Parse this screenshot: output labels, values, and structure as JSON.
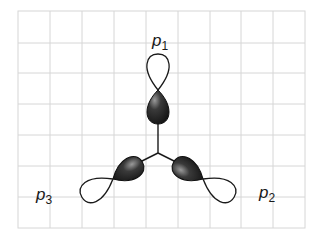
{
  "diagram": {
    "grid": {
      "x0": 18,
      "y0": 11,
      "x1": 305,
      "y1": 228,
      "cols": 9,
      "rows": 7,
      "color": "#d6d6d6"
    },
    "labels": {
      "p1": {
        "base": "p",
        "sub": "1"
      },
      "p2": {
        "base": "p",
        "sub": "2"
      },
      "p3": {
        "base": "p",
        "sub": "3"
      }
    },
    "colors": {
      "dark_lobe": "#2a2a2a",
      "light_lobe": "#ffffff",
      "stroke": "#1a1a1a"
    }
  }
}
